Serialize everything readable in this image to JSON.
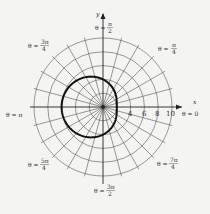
{
  "chart_data": {
    "type": "line",
    "coordinate_system": "polar",
    "title": "",
    "equation_depicted": "r = 4 - 2cos(theta)",
    "xlabel": "x",
    "ylabel": "y",
    "r_ticks": [
      4,
      6,
      8,
      10
    ],
    "grid_circles": [
      2,
      4,
      6,
      8,
      10
    ],
    "radial_grid_step_deg": 15,
    "rlim": [
      0,
      10
    ],
    "angle_labels": [
      {
        "angle": "0",
        "text": "θ = 0"
      },
      {
        "angle": "pi/4",
        "text": "θ = π/4"
      },
      {
        "angle": "pi/2",
        "text": "θ = π/2"
      },
      {
        "angle": "3pi/4",
        "text": "θ = 3π/4"
      },
      {
        "angle": "pi",
        "text": "θ = π"
      },
      {
        "angle": "5pi/4",
        "text": "θ = 5π/4"
      },
      {
        "angle": "3pi/2",
        "text": "θ = 3π/2"
      },
      {
        "angle": "7pi/4",
        "text": "θ = 7π/4"
      }
    ],
    "series": [
      {
        "name": "curve",
        "theta_deg": [
          0,
          45,
          90,
          135,
          180,
          225,
          270,
          315,
          360
        ],
        "r": [
          2,
          2.59,
          4,
          5.41,
          6,
          5.41,
          4,
          2.59,
          2
        ]
      }
    ],
    "grid": true,
    "legend": "none"
  },
  "labels": {
    "x_axis": "x",
    "y_axis": "y",
    "theta0_pre": "θ = 0",
    "thetaPi_pre": "θ = π",
    "theta_eq": "θ =",
    "pi4_num": "π",
    "pi4_den": "4",
    "pi2_num": "π",
    "pi2_den": "2",
    "three_pi4_num": "3π",
    "three_pi4_den": "4",
    "five_pi4_num": "5π",
    "five_pi4_den": "4",
    "three_pi2_num": "3π",
    "three_pi2_den": "2",
    "seven_pi4_num": "7π",
    "seven_pi4_den": "4",
    "tick4": "4",
    "tick6": "6",
    "tick8": "8",
    "tick10": "10"
  }
}
